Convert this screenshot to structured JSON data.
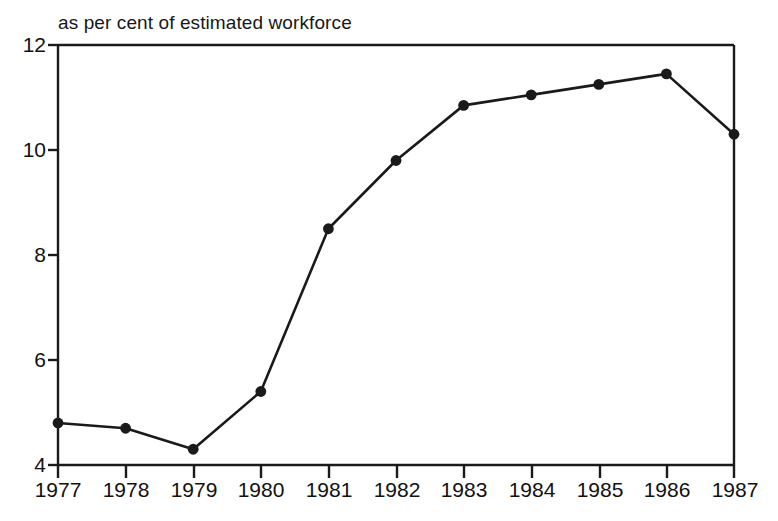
{
  "chart_data": {
    "type": "line",
    "title": "as per cent of estimated workforce",
    "xlabel": "",
    "ylabel": "",
    "categories": [
      "1977",
      "1978",
      "1979",
      "1980",
      "1981",
      "1982",
      "1983",
      "1984",
      "1985",
      "1986",
      "1987"
    ],
    "x": [
      1977,
      1978,
      1979,
      1980,
      1981,
      1982,
      1983,
      1984,
      1985,
      1986,
      1987
    ],
    "values": [
      4.8,
      4.7,
      4.3,
      5.4,
      8.5,
      9.8,
      10.85,
      11.05,
      11.25,
      11.45,
      10.3
    ],
    "series": [
      {
        "name": "unemployment as per cent of estimated workforce",
        "values": [
          4.8,
          4.7,
          4.3,
          5.4,
          8.5,
          9.8,
          10.85,
          11.05,
          11.25,
          11.45,
          10.3
        ]
      }
    ],
    "ylim": [
      4,
      12
    ],
    "xlim": [
      1977,
      1987
    ],
    "yticks": [
      4,
      6,
      8,
      10,
      12
    ],
    "ytick_labels": [
      "4",
      "6",
      "8",
      "10",
      "12"
    ],
    "xticks": [
      1977,
      1978,
      1979,
      1980,
      1981,
      1982,
      1983,
      1984,
      1985,
      1986,
      1987
    ],
    "xtick_labels": [
      "1977",
      "1978",
      "1979",
      "1980",
      "1981",
      "1982",
      "1983",
      "1984",
      "1985",
      "1986",
      "1987"
    ],
    "grid": false,
    "legend": false,
    "legend_position": "none",
    "marker": "filled-circle",
    "line_color": "#1a1a1a",
    "marker_color": "#1a1a1a",
    "axis_color": "#1a1a1a",
    "background_color": "#ffffff",
    "annotations": []
  },
  "axes": {
    "y_labels": [
      "12",
      "10",
      "8",
      "6",
      "4"
    ],
    "x_labels": [
      "1977",
      "1978",
      "1979",
      "1980",
      "1981",
      "1982",
      "1983",
      "1984",
      "1985",
      "1986",
      "1987"
    ]
  }
}
